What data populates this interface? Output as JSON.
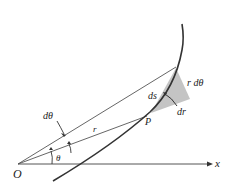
{
  "diagram": {
    "labels": {
      "origin": "O",
      "x_axis": "x",
      "point": "P",
      "radius": "r",
      "angle": "θ",
      "d_theta": "dθ",
      "ds": "ds",
      "dr": "dr",
      "r_dtheta": "r dθ"
    },
    "colors": {
      "line": "#444444",
      "curve": "#333333",
      "shade": "#bdbdbd"
    }
  }
}
